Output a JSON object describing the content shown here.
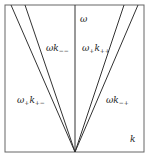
{
  "diagram": {
    "type": "dispersion-cone",
    "axis_labels": {
      "vertical": "ω",
      "horizontal": "k"
    },
    "regions": [
      {
        "id": "inner-left",
        "base": "ω",
        "base_sub": "",
        "k_sub": "−−"
      },
      {
        "id": "inner-right",
        "base": "ω",
        "base_sub": "+",
        "k_sub": "++"
      },
      {
        "id": "outer-left",
        "base": "ω",
        "base_sub": "+",
        "k_sub": "+−"
      },
      {
        "id": "outer-right",
        "base": "ω",
        "base_sub": "",
        "k_sub": "−+"
      }
    ],
    "colors": {
      "line": "#333333",
      "frame": "#555555",
      "background": "#ffffff"
    }
  }
}
